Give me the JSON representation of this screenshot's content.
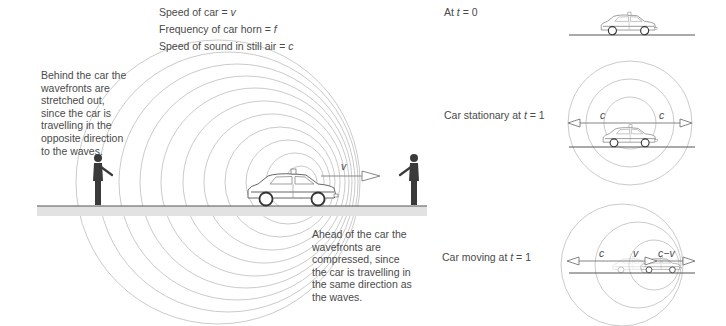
{
  "legend": {
    "line1_prefix": "Speed of car = ",
    "line1_var": "v",
    "line2_prefix": "Frequency of car horn = ",
    "line2_var": "f",
    "line3_prefix": "Speed of sound in still air = ",
    "line3_var": "c"
  },
  "annotations": {
    "behind": "Behind the car the wavefronts are stretched out, since the car is travelling in the opposite direction to the waves.",
    "ahead": "Ahead of the car the wavefronts are compressed, since the car is travelling in the same direction as the waves."
  },
  "main_diagram": {
    "velocity_label": "v"
  },
  "panels": [
    {
      "caption_prefix": "At ",
      "caption_var": "t",
      "caption_suffix": " = 0"
    },
    {
      "caption_prefix": "Car stationary at ",
      "caption_var": "t",
      "caption_suffix": " = 1",
      "left_label": "c",
      "right_label": "c"
    },
    {
      "caption_prefix": "Car moving at ",
      "caption_var": "t",
      "caption_suffix": " = 1",
      "left_label": "c",
      "middle_label": "v",
      "right_label": "c−v"
    }
  ],
  "colors": {
    "wave": "#c4c4c4",
    "road": "#e2e2e2",
    "road_edge": "#555555",
    "figure": "#3a3a3a",
    "text": "#4a4a4a"
  }
}
